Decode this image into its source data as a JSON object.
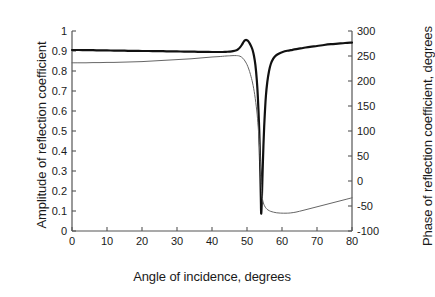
{
  "figure": {
    "background": "#ffffff",
    "plot_area": {
      "left": 72,
      "top": 31,
      "right": 352,
      "bottom": 231
    }
  },
  "chart_data": {
    "type": "line",
    "title": "",
    "xlabel": "Angle of incidence, degrees",
    "ylabel": "Amplitude of reflection coefficient",
    "ylabel_right": "Phase of reflection coefficient, degrees",
    "xlim": [
      0,
      80
    ],
    "ylim": [
      0,
      1
    ],
    "ylim_right": [
      -100,
      300
    ],
    "xticks": [
      0,
      10,
      20,
      30,
      40,
      50,
      60,
      70,
      80
    ],
    "yticks": [
      0,
      0.1,
      0.2,
      0.3,
      0.4,
      0.5,
      0.6,
      0.7,
      0.8,
      0.9,
      1
    ],
    "yticks_right": [
      -100,
      -50,
      0,
      50,
      100,
      150,
      200,
      250,
      300
    ],
    "xtick_labels": [
      "0",
      "10",
      "20",
      "30",
      "40",
      "50",
      "60",
      "70",
      "80"
    ],
    "ytick_labels": [
      "0",
      "0.1",
      "0.2",
      "0.3",
      "0.4",
      "0.5",
      "0.6",
      "0.7",
      "0.8",
      "0.9",
      "1"
    ],
    "ytick_right_labels": [
      "-100",
      "-50",
      "0",
      "50",
      "100",
      "150",
      "200",
      "250",
      "300"
    ],
    "grid": false,
    "legend": "none",
    "axis_color": "#555555",
    "series": [
      {
        "name": "Amplitude of reflection coefficient",
        "axis": "left",
        "color": "#111111",
        "width": 2.2,
        "x": [
          0,
          2,
          4,
          6,
          8,
          10,
          12,
          14,
          16,
          18,
          20,
          22,
          24,
          26,
          28,
          30,
          32,
          34,
          36,
          38,
          40,
          42,
          43,
          44,
          45,
          46,
          47,
          47.5,
          48,
          48.5,
          49,
          49.3,
          49.6,
          50,
          50.4,
          50.8,
          51.2,
          51.6,
          52,
          52.4,
          52.8,
          53.1,
          53.4,
          53.6,
          53.8,
          53.95,
          54.05,
          54.2,
          54.4,
          54.7,
          55,
          55.4,
          55.8,
          56.3,
          56.8,
          57.5,
          58.3,
          59.2,
          60.2,
          61.5,
          63,
          64.5,
          66,
          68,
          70,
          72,
          74,
          76,
          78,
          80
        ],
        "y": [
          0.905,
          0.905,
          0.904,
          0.904,
          0.903,
          0.903,
          0.902,
          0.902,
          0.901,
          0.901,
          0.9,
          0.9,
          0.899,
          0.899,
          0.898,
          0.898,
          0.897,
          0.897,
          0.896,
          0.896,
          0.895,
          0.895,
          0.895,
          0.896,
          0.897,
          0.899,
          0.904,
          0.909,
          0.918,
          0.93,
          0.945,
          0.952,
          0.955,
          0.954,
          0.948,
          0.937,
          0.923,
          0.905,
          0.875,
          0.83,
          0.755,
          0.67,
          0.55,
          0.44,
          0.3,
          0.17,
          0.088,
          0.135,
          0.26,
          0.43,
          0.555,
          0.675,
          0.745,
          0.8,
          0.835,
          0.862,
          0.878,
          0.888,
          0.895,
          0.901,
          0.906,
          0.911,
          0.915,
          0.921,
          0.925,
          0.93,
          0.934,
          0.937,
          0.94,
          0.942
        ]
      },
      {
        "name": "Phase of reflection coefficient, degrees",
        "axis": "right",
        "color": "#666666",
        "width": 1.0,
        "x": [
          0,
          2,
          4,
          6,
          8,
          10,
          12,
          14,
          16,
          18,
          20,
          22,
          24,
          26,
          28,
          30,
          32,
          34,
          36,
          38,
          40,
          42,
          44,
          45,
          46,
          47,
          47.6,
          48,
          48.4,
          48.8,
          49.2,
          49.6,
          50,
          50.5,
          51,
          51.6,
          52.2,
          52.8,
          53.2,
          53.6,
          53.9,
          54.1,
          54.3,
          54.6,
          55,
          55.5,
          56,
          56.8,
          57.6,
          58.5,
          59.5,
          60.5,
          61.5,
          62.5,
          64,
          66,
          68,
          70,
          72,
          74,
          76,
          78,
          80
        ],
        "y": [
          0.841,
          0.841,
          0.841,
          0.842,
          0.842,
          0.843,
          0.843,
          0.844,
          0.845,
          0.846,
          0.847,
          0.849,
          0.851,
          0.853,
          0.855,
          0.857,
          0.859,
          0.861,
          0.864,
          0.867,
          0.87,
          0.872,
          0.875,
          0.876,
          0.877,
          0.877,
          0.876,
          0.874,
          0.87,
          0.864,
          0.856,
          0.845,
          0.832,
          0.81,
          0.782,
          0.74,
          0.682,
          0.6,
          0.52,
          0.41,
          0.3,
          0.22,
          0.175,
          0.145,
          0.126,
          0.113,
          0.105,
          0.098,
          0.094,
          0.091,
          0.0895,
          0.089,
          0.0892,
          0.0905,
          0.0945,
          0.103,
          0.112,
          0.121,
          0.13,
          0.139,
          0.148,
          0.157,
          0.166
        ]
      }
    ]
  }
}
